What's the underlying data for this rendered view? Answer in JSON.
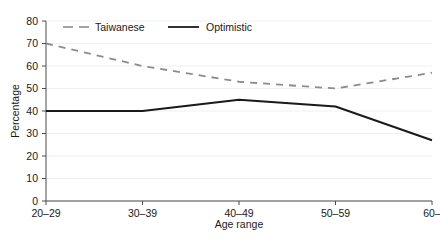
{
  "chart_data": {
    "type": "line",
    "title": "",
    "xlabel": "Age range",
    "ylabel": "Percentage",
    "categories": [
      "20–29",
      "30–39",
      "40–49",
      "50–59",
      "60–"
    ],
    "series": [
      {
        "name": "Taiwanese",
        "values": [
          70,
          60,
          53,
          50,
          57
        ],
        "color": "#8c8c8c",
        "style": "dashed"
      },
      {
        "name": "Optimistic",
        "values": [
          40,
          40,
          45,
          42,
          27
        ],
        "color": "#1a1a1a",
        "style": "solid"
      }
    ],
    "ylim": [
      0,
      80
    ],
    "yticks": [
      0,
      10,
      20,
      30,
      40,
      50,
      60,
      70,
      80
    ],
    "ytick_labels": [
      "0",
      "10",
      "20",
      "30",
      "40",
      "50",
      "60",
      "70",
      "80"
    ],
    "grid": true,
    "grid_color": "#f0f0f3",
    "legend_position": "top-left-inside",
    "axis_color": "#4d4d4d"
  },
  "legend": {
    "entries": [
      {
        "label": "Taiwanese",
        "icon": "dashed-line-swatch"
      },
      {
        "label": "Optimistic",
        "icon": "solid-line-swatch"
      }
    ]
  },
  "axes": {
    "y_title": "Percentage",
    "x_title": "Age range"
  }
}
